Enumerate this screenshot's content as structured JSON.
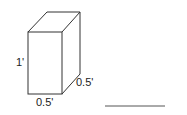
{
  "diagram": {
    "shape": "rectangular-prism",
    "labels": {
      "height": "1'",
      "depth": "0.5'",
      "width": "0.5'"
    },
    "answer_blank": ""
  }
}
